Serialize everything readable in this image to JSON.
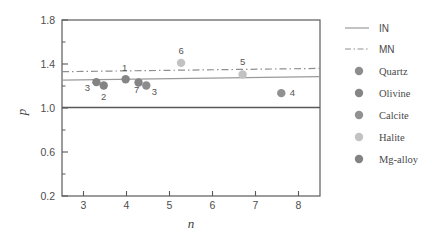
{
  "chart_data": {
    "type": "scatter",
    "title": "",
    "xlabel": "n",
    "ylabel": "p",
    "xlim": [
      2.5,
      8.5
    ],
    "ylim": [
      0.2,
      1.8
    ],
    "xticks": [
      3,
      4,
      5,
      6,
      7,
      8
    ],
    "xtick_labels": [
      "3",
      "4",
      "5",
      "6",
      "7",
      "8"
    ],
    "yticks": [
      0.2,
      0.6,
      1.0,
      1.4,
      1.8
    ],
    "ytick_labels": [
      "0.2",
      "0.6",
      "1.0",
      "1.4",
      "1.8"
    ],
    "yticks_minor": [
      0.4,
      0.8,
      1.2,
      1.6
    ],
    "grid": false,
    "legend_position": "right",
    "points": [
      {
        "label": "3",
        "n": 3.3,
        "p": 1.235,
        "series": "Mg-alloy",
        "label_dx": -9,
        "label_dy": 9
      },
      {
        "label": "2",
        "n": 3.47,
        "p": 1.205,
        "series": "Mg-alloy",
        "label_dx": 0,
        "label_dy": 15
      },
      {
        "label": "1",
        "n": 3.98,
        "p": 1.262,
        "series": "Olivine",
        "label_dx": -1,
        "label_dy": -8
      },
      {
        "label": "7",
        "n": 4.28,
        "p": 1.232,
        "series": "Olivine",
        "label_dx": -2,
        "label_dy": 11
      },
      {
        "label": "3",
        "n": 4.46,
        "p": 1.205,
        "series": "Quartz",
        "label_dx": 8,
        "label_dy": 10
      },
      {
        "label": "6",
        "n": 5.27,
        "p": 1.41,
        "series": "Halite",
        "label_dx": 0,
        "label_dy": -9
      },
      {
        "label": "5",
        "n": 6.7,
        "p": 1.305,
        "series": "Halite",
        "label_dx": 0,
        "label_dy": -9
      },
      {
        "label": "4",
        "n": 7.6,
        "p": 1.135,
        "series": "Calcite",
        "label_dx": 11,
        "label_dy": 3
      }
    ],
    "lines": [
      {
        "name": "IN",
        "style": "solid",
        "color": "#9a9a9a",
        "x1": 2.5,
        "y1": 1.253,
        "x2": 8.5,
        "y2": 1.285
      },
      {
        "name": "MN",
        "style": "dashdot",
        "color": "#8f8f8f",
        "x1": 2.5,
        "y1": 1.33,
        "x2": 8.5,
        "y2": 1.36
      },
      {
        "name": "baseline",
        "style": "solid",
        "color": "#595959",
        "x1": 2.5,
        "y1": 1.005,
        "x2": 8.5,
        "y2": 1.005
      }
    ],
    "series_colors": {
      "Quartz": "#8d8d8d",
      "Olivine": "#858585",
      "Calcite": "#919191",
      "Halite": "#c2c2c2",
      "Mg-alloy": "#838383"
    },
    "legend": {
      "lines": [
        {
          "label": "IN",
          "style": "solid",
          "color": "#9a9a9a"
        },
        {
          "label": "MN",
          "style": "dashdot",
          "color": "#8f8f8f"
        }
      ],
      "markers": [
        {
          "label": "Quartz",
          "color": "#8d8d8d"
        },
        {
          "label": "Olivine",
          "color": "#858585"
        },
        {
          "label": "Calcite",
          "color": "#919191"
        },
        {
          "label": "Halite",
          "color": "#c2c2c2"
        },
        {
          "label": "Mg-alloy",
          "color": "#838383"
        }
      ]
    }
  }
}
